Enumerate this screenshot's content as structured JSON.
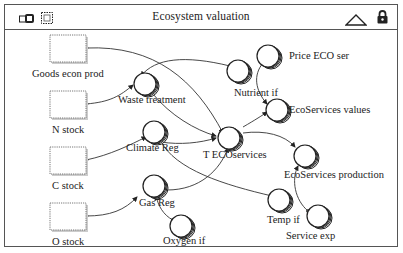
{
  "window": {
    "title": "Ecosystem valuation",
    "icons": {
      "left": [
        "model-icon",
        "stock-layout-icon"
      ],
      "right": [
        "triangle-up-icon",
        "lock-icon"
      ]
    }
  },
  "diagram": {
    "stocks": [
      {
        "id": "goods",
        "label": "Goods econ prod"
      },
      {
        "id": "nstock",
        "label": "N stock"
      },
      {
        "id": "cstock",
        "label": "C stock"
      },
      {
        "id": "ostock",
        "label": "O stock"
      }
    ],
    "variables": [
      {
        "id": "waste",
        "label": "Waste treatment"
      },
      {
        "id": "nutrient",
        "label": "Nutrient if"
      },
      {
        "id": "climate",
        "label": "Climate Reg"
      },
      {
        "id": "tec",
        "label": "T ECOservices"
      },
      {
        "id": "gas",
        "label": "Gas Reg"
      },
      {
        "id": "oxygen",
        "label": "Oxygen if"
      },
      {
        "id": "temp",
        "label": "Temp if"
      },
      {
        "id": "price",
        "label": "Price ECO ser"
      },
      {
        "id": "ecovalues",
        "label": "EcoServices values"
      },
      {
        "id": "ecoprod",
        "label": "EcoServices production"
      },
      {
        "id": "servexp",
        "label": "Service exp"
      }
    ],
    "links": [
      {
        "from": "goods",
        "to": "tec"
      },
      {
        "from": "nstock",
        "to": "waste"
      },
      {
        "from": "nutrient",
        "to": "waste"
      },
      {
        "from": "waste",
        "to": "tec"
      },
      {
        "from": "cstock",
        "to": "climate"
      },
      {
        "from": "climate",
        "to": "tec"
      },
      {
        "from": "temp",
        "to": "climate"
      },
      {
        "from": "ostock",
        "to": "gas"
      },
      {
        "from": "oxygen",
        "to": "gas"
      },
      {
        "from": "gas",
        "to": "tec"
      },
      {
        "from": "tec",
        "to": "ecovalues"
      },
      {
        "from": "price",
        "to": "ecovalues"
      },
      {
        "from": "tec",
        "to": "ecoprod"
      },
      {
        "from": "servexp",
        "to": "ecoprod"
      }
    ]
  }
}
